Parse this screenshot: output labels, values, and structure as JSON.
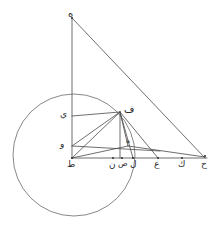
{
  "figure": {
    "type": "line-diagram",
    "background_color": "#ffffff",
    "stroke_color": "#4a4a4a",
    "label_color": "#2b2b2b",
    "canvas": {
      "width": 222,
      "height": 235
    }
  },
  "points": {
    "he_top": {
      "label": "ه",
      "x": 72,
      "y": 18,
      "label_x": 68,
      "label_y": 9
    },
    "ya": {
      "label": "ي",
      "x": 72,
      "y": 116,
      "label_x": 60,
      "label_y": 110
    },
    "fa": {
      "label": "ف",
      "x": 120,
      "y": 112,
      "label_x": 124,
      "label_y": 104
    },
    "waw": {
      "label": "و",
      "x": 72,
      "y": 146,
      "label_x": 60,
      "label_y": 140
    },
    "ta": {
      "label": "ط",
      "x": 72,
      "y": 158,
      "label_x": 67,
      "label_y": 160
    },
    "nun": {
      "label": "ن",
      "x": 113,
      "y": 158,
      "label_x": 109,
      "label_y": 160
    },
    "sad": {
      "label": "ص",
      "x": 122,
      "y": 158,
      "label_x": 118,
      "label_y": 160
    },
    "lam": {
      "label": "ل",
      "x": 133,
      "y": 158,
      "label_x": 130,
      "label_y": 160
    },
    "ayn": {
      "label": "ع",
      "x": 158,
      "y": 158,
      "label_x": 154,
      "label_y": 160
    },
    "kaf": {
      "label": "ك",
      "x": 182,
      "y": 158,
      "label_x": 178,
      "label_y": 160
    },
    "ha": {
      "label": "ح",
      "x": 205,
      "y": 158,
      "label_x": 201,
      "label_y": 160
    },
    "he_mid": {
      "label": "ه",
      "x": 128,
      "y": 145,
      "label_x": 126,
      "label_y": 137
    }
  },
  "circle": {
    "center_x": 74,
    "center_y": 155,
    "radius": 61
  },
  "segments": [
    {
      "name": "he-top-to-ta-vertical",
      "x1": 72,
      "y1": 18,
      "x2": 72,
      "y2": 158
    },
    {
      "name": "he-top-to-ha",
      "x1": 72,
      "y1": 18,
      "x2": 205,
      "y2": 158
    },
    {
      "name": "baseline-ta-to-ha",
      "x1": 72,
      "y1": 158,
      "x2": 207,
      "y2": 158
    },
    {
      "name": "ya-to-fa-horizontal",
      "x1": 72,
      "y1": 116,
      "x2": 120,
      "y2": 112
    },
    {
      "name": "waw-to-hemid",
      "x1": 72,
      "y1": 146,
      "x2": 160,
      "y2": 151
    },
    {
      "name": "fa-to-nun-vertical",
      "x1": 120,
      "y1": 112,
      "x2": 120,
      "y2": 158
    },
    {
      "name": "fa-to-ta-diagonal",
      "x1": 120,
      "y1": 112,
      "x2": 72,
      "y2": 158
    },
    {
      "name": "fa-to-waw-diagonal",
      "x1": 120,
      "y1": 112,
      "x2": 72,
      "y2": 146
    },
    {
      "name": "fa-to-hemid",
      "x1": 120,
      "y1": 112,
      "x2": 128,
      "y2": 146
    },
    {
      "name": "fa-to-lam",
      "x1": 120,
      "y1": 112,
      "x2": 133,
      "y2": 158
    },
    {
      "name": "fa-to-ayn",
      "x1": 120,
      "y1": 112,
      "x2": 158,
      "y2": 158
    },
    {
      "name": "ta-to-hemid",
      "x1": 72,
      "y1": 158,
      "x2": 128,
      "y2": 146
    },
    {
      "name": "hemid-to-ha",
      "x1": 128,
      "y1": 146,
      "x2": 205,
      "y2": 157
    }
  ],
  "tick_dots": [
    {
      "name": "dot-he-top",
      "x": 72,
      "y": 18
    },
    {
      "name": "dot-ta",
      "x": 72,
      "y": 158
    },
    {
      "name": "dot-nun",
      "x": 113,
      "y": 158
    },
    {
      "name": "dot-sad",
      "x": 122,
      "y": 158
    },
    {
      "name": "dot-lam",
      "x": 133,
      "y": 158
    },
    {
      "name": "dot-ayn",
      "x": 158,
      "y": 158
    },
    {
      "name": "dot-kaf",
      "x": 182,
      "y": 158
    },
    {
      "name": "dot-ha",
      "x": 205,
      "y": 156
    }
  ]
}
